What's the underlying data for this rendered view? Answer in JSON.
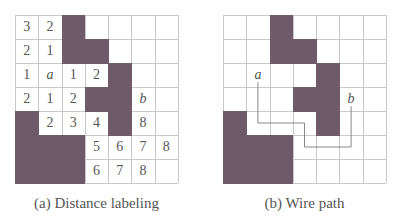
{
  "colors": {
    "blocked": "#6e5a68",
    "grid_line": "#c8c8c8",
    "wire": "#888888",
    "text": "#555555"
  },
  "grid": {
    "cols": 7,
    "rows": 7
  },
  "blocked_cells": [
    [
      0,
      2
    ],
    [
      1,
      2
    ],
    [
      1,
      3
    ],
    [
      2,
      4
    ],
    [
      3,
      3
    ],
    [
      3,
      4
    ],
    [
      4,
      0
    ],
    [
      4,
      4
    ],
    [
      5,
      0
    ],
    [
      5,
      1
    ],
    [
      5,
      2
    ],
    [
      6,
      0
    ],
    [
      6,
      1
    ],
    [
      6,
      2
    ]
  ],
  "panel_a": {
    "caption": "(a) Distance labeling",
    "cells": [
      {
        "r": 0,
        "c": 0,
        "t": "3"
      },
      {
        "r": 0,
        "c": 1,
        "t": "2"
      },
      {
        "r": 1,
        "c": 0,
        "t": "2"
      },
      {
        "r": 1,
        "c": 1,
        "t": "1"
      },
      {
        "r": 2,
        "c": 0,
        "t": "1"
      },
      {
        "r": 2,
        "c": 1,
        "t": "a",
        "label": true
      },
      {
        "r": 2,
        "c": 2,
        "t": "1"
      },
      {
        "r": 2,
        "c": 3,
        "t": "2"
      },
      {
        "r": 3,
        "c": 0,
        "t": "2"
      },
      {
        "r": 3,
        "c": 1,
        "t": "1"
      },
      {
        "r": 3,
        "c": 2,
        "t": "2"
      },
      {
        "r": 3,
        "c": 5,
        "t": "b",
        "label": true
      },
      {
        "r": 4,
        "c": 1,
        "t": "2"
      },
      {
        "r": 4,
        "c": 2,
        "t": "3"
      },
      {
        "r": 4,
        "c": 3,
        "t": "4"
      },
      {
        "r": 4,
        "c": 5,
        "t": "8"
      },
      {
        "r": 5,
        "c": 3,
        "t": "5"
      },
      {
        "r": 5,
        "c": 4,
        "t": "6"
      },
      {
        "r": 5,
        "c": 5,
        "t": "7"
      },
      {
        "r": 5,
        "c": 6,
        "t": "8"
      },
      {
        "r": 6,
        "c": 3,
        "t": "6"
      },
      {
        "r": 6,
        "c": 4,
        "t": "7"
      },
      {
        "r": 6,
        "c": 5,
        "t": "8"
      }
    ]
  },
  "panel_b": {
    "caption": "(b) Wire path",
    "cells": [
      {
        "r": 2,
        "c": 1,
        "t": "a",
        "label": true
      },
      {
        "r": 3,
        "c": 5,
        "t": "b",
        "label": true
      }
    ],
    "wire_path": [
      [
        1,
        2.3
      ],
      [
        1,
        4
      ],
      [
        3,
        4
      ],
      [
        3,
        5
      ],
      [
        5,
        5
      ],
      [
        5,
        3.3
      ]
    ]
  }
}
